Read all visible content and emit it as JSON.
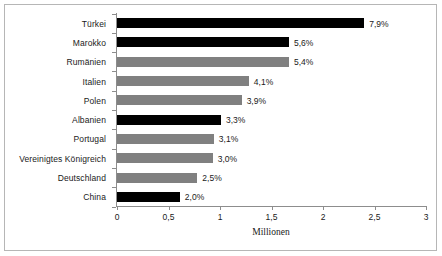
{
  "chart_data": {
    "type": "bar",
    "orientation": "horizontal",
    "title": "",
    "xlabel": "Millionen",
    "ylabel": "",
    "xlim": [
      0,
      3
    ],
    "xticks": [
      "0",
      "0,5",
      "1",
      "1,5",
      "2",
      "2,5",
      "3"
    ],
    "xtick_values": [
      0,
      0.5,
      1,
      1.5,
      2,
      2.5,
      3
    ],
    "grid": false,
    "legend": false,
    "categories": [
      "Türkei",
      "Marokko",
      "Rumänien",
      "Italien",
      "Polen",
      "Albanien",
      "Portugal",
      "Vereinigtes Königreich",
      "Deutschland",
      "China"
    ],
    "values": [
      2.4,
      1.67,
      1.67,
      1.28,
      1.21,
      1.01,
      0.94,
      0.93,
      0.78,
      0.61
    ],
    "data_labels": [
      "7,9%",
      "5,6%",
      "5,4%",
      "4,1%",
      "3,9%",
      "3,3%",
      "3,1%",
      "3,0%",
      "2,5%",
      "2,0%"
    ],
    "bar_colors": [
      "#000000",
      "#000000",
      "#808080",
      "#808080",
      "#808080",
      "#000000",
      "#808080",
      "#808080",
      "#808080",
      "#000000"
    ],
    "colors": {
      "black": "#000000",
      "gray": "#808080",
      "axis": "#8d8d8d",
      "frame": "#b6b6b6",
      "text": "#1a1a1a",
      "background": "#ffffff"
    }
  }
}
